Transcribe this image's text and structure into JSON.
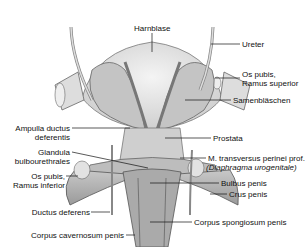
{
  "figure": {
    "labels": {
      "harnblase": "Harnblase",
      "ureter": "Ureter",
      "os_pubis_sup_1": "Os pubis,",
      "os_pubis_sup_2": "Ramus superior",
      "samenblaeschen": "Samenbläschen",
      "ampulla_1": "Ampulla ductus",
      "ampulla_2": "deferentis",
      "prostata": "Prostata",
      "glandula_1": "Glandula",
      "glandula_2": "bulbourethrales",
      "m_transversus": "M. transversus perinei prof.",
      "diaphragma": "(Diaphragma urogenitale)",
      "os_pubis_inf_1": "Os pubis,",
      "os_pubis_inf_2": "Ramus inferior",
      "bulbus": "Bulbus penis",
      "crus": "Crus penis",
      "ductus_deferens": "Ductus deferens",
      "corpus_spongiosum": "Corpus spongiosum penis",
      "corpus_cavernosum": "Corpus cavernosum penis"
    }
  }
}
